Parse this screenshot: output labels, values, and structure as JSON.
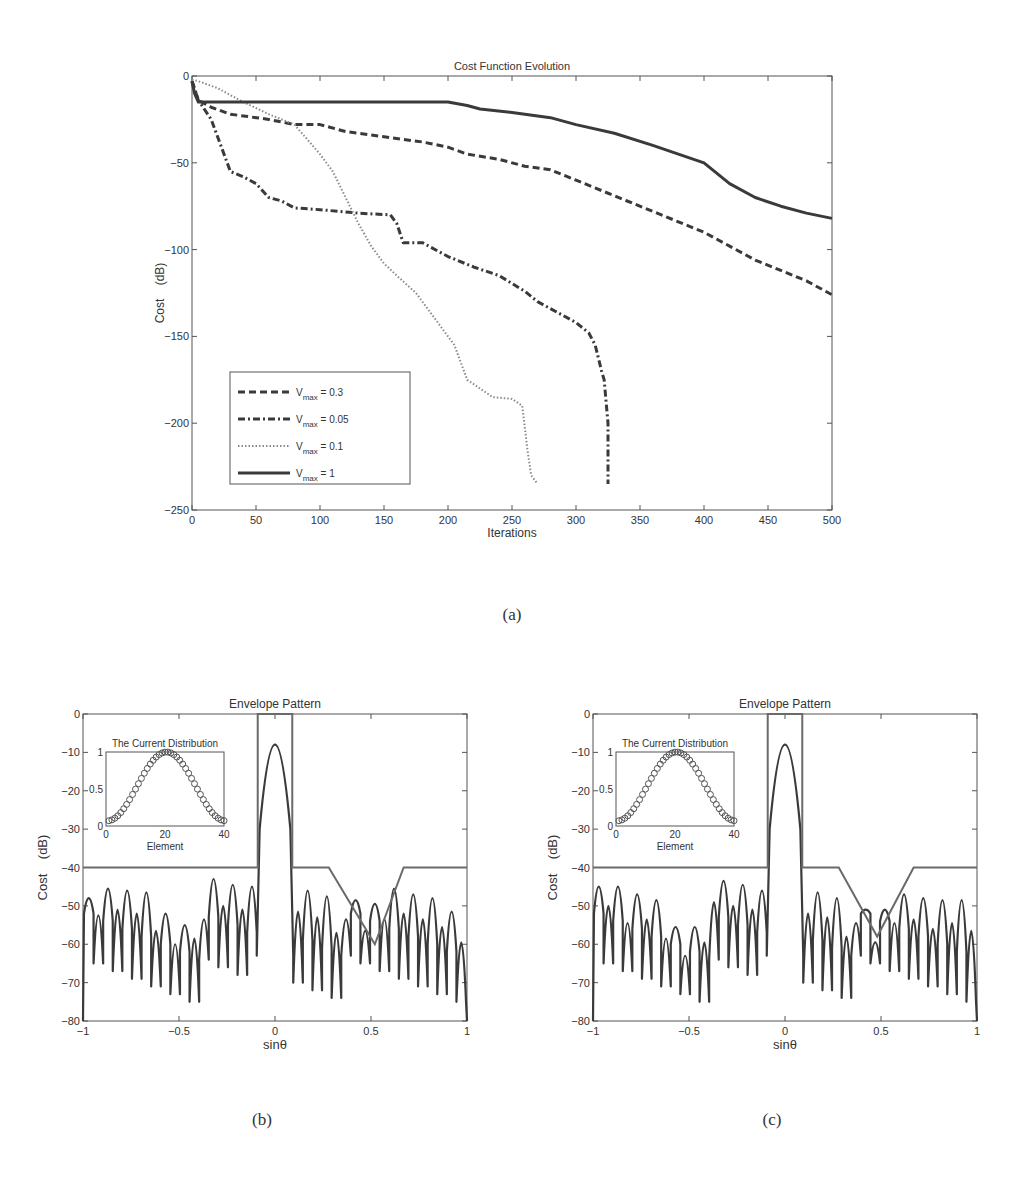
{
  "captions": {
    "a": "(a)",
    "b": "(b)",
    "c": "(c)"
  },
  "chart_data": [
    {
      "id": "a",
      "type": "line",
      "title": "Cost Function Evolution",
      "xlabel": "Iterations",
      "ylabel": "Cost    (dB)",
      "xlim": [
        0,
        500
      ],
      "ylim": [
        -250,
        0
      ],
      "xticks": [
        0,
        50,
        100,
        150,
        200,
        250,
        300,
        350,
        400,
        450,
        500
      ],
      "yticks": [
        0,
        -50,
        -100,
        -150,
        -200,
        -250
      ],
      "grid": false,
      "legend_position": "lower-left",
      "series": [
        {
          "name": "V_max = 0.3",
          "label_main": "V",
          "label_sub": "max",
          "label_rest": " = 0.3",
          "style": "dashed",
          "x": [
            0,
            5,
            15,
            30,
            60,
            80,
            100,
            120,
            150,
            180,
            200,
            215,
            240,
            260,
            280,
            300,
            320,
            340,
            360,
            380,
            400,
            420,
            440,
            460,
            480,
            500
          ],
          "y": [
            -3,
            -14,
            -18,
            -22,
            -25,
            -28,
            -28,
            -32,
            -35,
            -38,
            -41,
            -45,
            -48,
            -52,
            -54,
            -60,
            -66,
            -72,
            -78,
            -84,
            -90,
            -98,
            -106,
            -112,
            -118,
            -126
          ]
        },
        {
          "name": "V_max = 0.05",
          "label_main": "V",
          "label_sub": "max",
          "label_rest": " = 0.05",
          "style": "dashdot",
          "x": [
            0,
            5,
            15,
            25,
            30,
            40,
            50,
            60,
            70,
            80,
            100,
            130,
            155,
            160,
            165,
            180,
            200,
            220,
            240,
            260,
            270,
            290,
            300,
            310,
            315,
            320,
            322,
            325,
            325
          ],
          "y": [
            -3,
            -14,
            -25,
            -45,
            -55,
            -58,
            -62,
            -70,
            -72,
            -76,
            -77,
            -79,
            -80,
            -85,
            -96,
            -96,
            -104,
            -110,
            -115,
            -124,
            -130,
            -138,
            -142,
            -148,
            -155,
            -170,
            -175,
            -200,
            -235
          ]
        },
        {
          "name": "V_max = 0.1",
          "label_main": "V",
          "label_sub": "max",
          "label_rest": " = 0.1",
          "style": "dotted",
          "x": [
            0,
            5,
            20,
            40,
            60,
            80,
            100,
            110,
            120,
            130,
            140,
            150,
            160,
            175,
            185,
            195,
            205,
            210,
            215,
            225,
            235,
            250,
            258,
            262,
            265,
            270
          ],
          "y": [
            -2,
            -3,
            -7,
            -15,
            -22,
            -28,
            -45,
            -55,
            -70,
            -85,
            -98,
            -108,
            -115,
            -125,
            -135,
            -145,
            -155,
            -165,
            -175,
            -180,
            -185,
            -186,
            -190,
            -215,
            -230,
            -235
          ]
        },
        {
          "name": "V_max = 1",
          "label_main": "V",
          "label_sub": "max",
          "label_rest": " = 1",
          "style": "solid",
          "x": [
            0,
            2,
            5,
            50,
            100,
            150,
            200,
            215,
            225,
            250,
            280,
            300,
            330,
            360,
            380,
            400,
            420,
            440,
            460,
            480,
            500
          ],
          "y": [
            -3,
            -10,
            -15,
            -15,
            -15,
            -15,
            -15,
            -17,
            -19,
            -21,
            -24,
            -28,
            -33,
            -40,
            -45,
            -50,
            -62,
            -70,
            -75,
            -79,
            -82
          ]
        }
      ]
    },
    {
      "id": "b",
      "type": "line",
      "title": "Envelope Pattern",
      "xlabel": "sinθ",
      "ylabel": "Cost    (dB)",
      "xlim": [
        -1,
        1
      ],
      "ylim": [
        -80,
        0
      ],
      "xticks": [
        -1,
        -0.5,
        0,
        0.5,
        1
      ],
      "yticks": [
        0,
        -10,
        -20,
        -30,
        -40,
        -50,
        -60,
        -70,
        -80
      ],
      "mask": {
        "x": [
          -1,
          -0.09,
          -0.09,
          0.09,
          0.09,
          0.28,
          0.46,
          0.52,
          0.67,
          1
        ],
        "y": [
          -40,
          -40,
          0,
          0,
          -40,
          -40,
          -55,
          -60,
          -40,
          -40
        ]
      },
      "sidelobe_peaks": {
        "x": [
          -0.97,
          -0.92,
          -0.87,
          -0.82,
          -0.77,
          -0.72,
          -0.67,
          -0.62,
          -0.57,
          -0.52,
          -0.47,
          -0.42,
          -0.37,
          -0.32,
          -0.27,
          -0.22,
          -0.17,
          -0.12,
          0.12,
          0.17,
          0.22,
          0.27,
          0.32,
          0.37,
          0.42,
          0.47,
          0.52,
          0.57,
          0.62,
          0.67,
          0.72,
          0.77,
          0.82,
          0.87,
          0.92,
          0.97
        ],
        "y": [
          -50,
          -46,
          -43,
          -41,
          -42,
          -41,
          -41,
          -48,
          -50,
          -53,
          -54,
          -48,
          -49,
          -39,
          -40,
          -40,
          -40,
          -39,
          -39,
          -39,
          -40,
          -40,
          -46,
          -50,
          -51,
          -54,
          -51,
          -46,
          -41,
          -41,
          -42,
          -42,
          -42,
          -44,
          -47,
          -50
        ]
      },
      "inset": {
        "title": "The Current Distribution",
        "xlabel": "Element",
        "xticks": [
          0,
          20,
          40
        ],
        "yticks": [
          0,
          0.5,
          1
        ],
        "xlim": [
          0,
          40
        ],
        "ylim": [
          0,
          1
        ],
        "marker": "circle",
        "elements": 40,
        "shape": "raised-cosine peak 1 at element 20, ~0.07 at ends"
      }
    },
    {
      "id": "c",
      "type": "line",
      "title": "Envelope Pattern",
      "xlabel": "sinθ",
      "ylabel": "Cost    (dB)",
      "xlim": [
        -1,
        1
      ],
      "ylim": [
        -80,
        0
      ],
      "xticks": [
        -1,
        -0.5,
        0,
        0.5,
        1
      ],
      "yticks": [
        0,
        -10,
        -20,
        -30,
        -40,
        -50,
        -60,
        -70,
        -80
      ],
      "mask": {
        "x": [
          -1,
          -0.09,
          -0.09,
          0.09,
          0.09,
          0.28,
          0.48,
          0.67,
          1
        ],
        "y": [
          -40,
          -40,
          0,
          0,
          -40,
          -40,
          -58,
          -40,
          -40
        ]
      },
      "sidelobe_peaks": {
        "x": [
          -0.97,
          -0.92,
          -0.87,
          -0.82,
          -0.77,
          -0.72,
          -0.67,
          -0.62,
          -0.57,
          -0.52,
          -0.47,
          -0.42,
          -0.37,
          -0.32,
          -0.27,
          -0.22,
          -0.17,
          -0.12,
          0.12,
          0.17,
          0.22,
          0.27,
          0.32,
          0.37,
          0.42,
          0.47,
          0.52,
          0.57,
          0.62,
          0.67,
          0.72,
          0.77,
          0.82,
          0.87,
          0.92,
          0.97
        ],
        "y": [
          -44,
          -41,
          -42,
          -48,
          -44,
          -44,
          -45,
          -52,
          -57,
          -59,
          -55,
          -50,
          -40,
          -40,
          -40,
          -40,
          -40,
          -41,
          -40,
          -40,
          -40,
          -41,
          -48,
          -52,
          -56,
          -60,
          -54,
          -48,
          -44,
          -44,
          -44,
          -47,
          -43,
          -42,
          -41,
          -44
        ]
      },
      "inset": {
        "title": "The Current Distribution",
        "xlabel": "Element",
        "xticks": [
          0,
          20,
          40
        ],
        "yticks": [
          0,
          0.5,
          1
        ],
        "xlim": [
          0,
          40
        ],
        "ylim": [
          0,
          1
        ],
        "marker": "circle",
        "elements": 40,
        "shape": "raised-cosine peak 1 at element 20, ~0.07 at ends"
      }
    }
  ]
}
